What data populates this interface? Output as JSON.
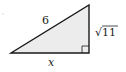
{
  "diagram": {
    "type": "right-triangle",
    "hypotenuse_label": "6",
    "vertical_leg_label": "√11",
    "horizontal_leg_label": "x",
    "fill_color": "#ececec",
    "stroke_color": "#1a1a1a",
    "right_angle_marker": true
  }
}
